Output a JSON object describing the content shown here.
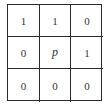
{
  "diagram": {
    "type": "pixel-neighborhood-3x3",
    "cells": [
      [
        "1",
        "1",
        "0"
      ],
      [
        "0",
        "p",
        "1"
      ],
      [
        "0",
        "0",
        "0"
      ]
    ]
  }
}
